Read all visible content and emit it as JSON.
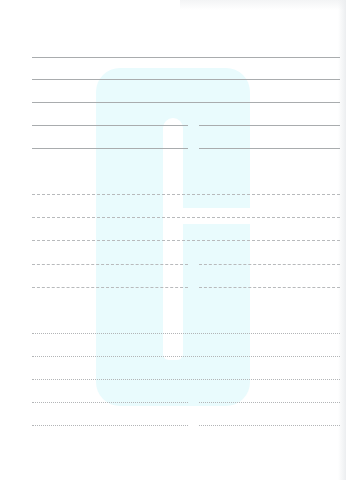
{
  "page": {
    "type": "blank lined form",
    "watermark": {
      "shape": "rounded-arch",
      "color": "#e9fbfd"
    },
    "colors": {
      "background": "#ffffff",
      "line": "#a9acae"
    }
  },
  "sections": [
    {
      "style": "solid",
      "lines": [
        {
          "y": 57,
          "split": false
        },
        {
          "y": 79,
          "split": false
        },
        {
          "y": 102,
          "split": false
        },
        {
          "y": 125,
          "split": true
        },
        {
          "y": 148,
          "split": true
        }
      ]
    },
    {
      "style": "dashed",
      "lines": [
        {
          "y": 194,
          "split": false
        },
        {
          "y": 217,
          "split": false
        },
        {
          "y": 240,
          "split": false
        },
        {
          "y": 264,
          "split": true
        },
        {
          "y": 287,
          "split": true
        }
      ]
    },
    {
      "style": "dotted",
      "lines": [
        {
          "y": 333,
          "split": false
        },
        {
          "y": 356,
          "split": false
        },
        {
          "y": 379,
          "split": false
        },
        {
          "y": 402,
          "split": true
        },
        {
          "y": 425,
          "split": true
        }
      ]
    }
  ]
}
